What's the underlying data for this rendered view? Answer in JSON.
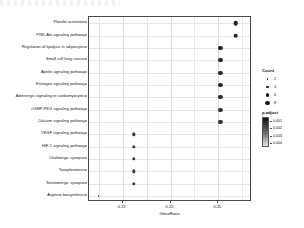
{
  "chart_data": {
    "type": "scatter",
    "plot_style": "dotplot",
    "title": "",
    "xlabel": "GeneRatio",
    "ylabel": "",
    "xlim": [
      0.115,
      0.285
    ],
    "xticks": [
      0.15,
      0.2,
      0.25
    ],
    "xticklabels": [
      "0.15",
      "0.20",
      "0.25"
    ],
    "grid": true,
    "categories": [
      "Platelet activation",
      "PI3K-Akt signaling pathway",
      "Regulation of lipolysis in adipocytes",
      "Small cell lung cancer",
      "Apelin signaling pathway",
      "Estrogen signaling pathway",
      "Adrenergic signaling in cardiomyocytes",
      "cGMP-PKG signaling pathway",
      "Calcium signaling pathway",
      "VEGF signaling pathway",
      "HIF-1 signaling pathway",
      "Cholinergic synapse",
      "Toxoplasmosis",
      "Serotonergic synapse",
      "Arginine biosynthesis"
    ],
    "points": [
      {
        "pathway": "Platelet activation",
        "gene_ratio": 0.268,
        "count": 8,
        "p_adjust": 0.001,
        "size_px": 4.6,
        "color": "#1c1c1c"
      },
      {
        "pathway": "PI3K-Akt signaling pathway",
        "gene_ratio": 0.268,
        "count": 8,
        "p_adjust": 0.002,
        "size_px": 4.6,
        "color": "#1f1f1f"
      },
      {
        "pathway": "Regulation of lipolysis in adipocytes",
        "gene_ratio": 0.252,
        "count": 7,
        "p_adjust": 0.002,
        "size_px": 4.2,
        "color": "#222222"
      },
      {
        "pathway": "Small cell lung cancer",
        "gene_ratio": 0.252,
        "count": 7,
        "p_adjust": 0.002,
        "size_px": 4.2,
        "color": "#242424"
      },
      {
        "pathway": "Apelin signaling pathway",
        "gene_ratio": 0.252,
        "count": 7,
        "p_adjust": 0.003,
        "size_px": 4.2,
        "color": "#272727"
      },
      {
        "pathway": "Estrogen signaling pathway",
        "gene_ratio": 0.252,
        "count": 7,
        "p_adjust": 0.003,
        "size_px": 4.2,
        "color": "#2a2a2a"
      },
      {
        "pathway": "Adrenergic signaling in cardiomyocytes",
        "gene_ratio": 0.252,
        "count": 7,
        "p_adjust": 0.003,
        "size_px": 4.2,
        "color": "#2c2c2c"
      },
      {
        "pathway": "cGMP-PKG signaling pathway",
        "gene_ratio": 0.252,
        "count": 7,
        "p_adjust": 0.004,
        "size_px": 4.2,
        "color": "#2f2f2f"
      },
      {
        "pathway": "Calcium signaling pathway",
        "gene_ratio": 0.252,
        "count": 7,
        "p_adjust": 0.004,
        "size_px": 4.2,
        "color": "#313131"
      },
      {
        "pathway": "VEGF signaling pathway",
        "gene_ratio": 0.162,
        "count": 5,
        "p_adjust": 0.004,
        "size_px": 3.4,
        "color": "#343434"
      },
      {
        "pathway": "HIF-1 signaling pathway",
        "gene_ratio": 0.162,
        "count": 5,
        "p_adjust": 0.004,
        "size_px": 3.4,
        "color": "#363636"
      },
      {
        "pathway": "Cholinergic synapse",
        "gene_ratio": 0.162,
        "count": 5,
        "p_adjust": 0.005,
        "size_px": 3.4,
        "color": "#383838"
      },
      {
        "pathway": "Toxoplasmosis",
        "gene_ratio": 0.162,
        "count": 5,
        "p_adjust": 0.005,
        "size_px": 3.4,
        "color": "#3a3a3a"
      },
      {
        "pathway": "Serotonergic synapse",
        "gene_ratio": 0.162,
        "count": 5,
        "p_adjust": 0.005,
        "size_px": 3.4,
        "color": "#3c3c3c"
      },
      {
        "pathway": "Arginine biosynthesis",
        "gene_ratio": 0.125,
        "count": 2,
        "p_adjust": 0.005,
        "size_px": 1.8,
        "color": "#3e3e3e"
      }
    ],
    "legends": {
      "size": {
        "title": "Count",
        "entries": [
          {
            "label": "2",
            "value": 2,
            "size_px": 1.9
          },
          {
            "label": "4",
            "value": 4,
            "size_px": 2.9
          },
          {
            "label": "6",
            "value": 6,
            "size_px": 3.9
          },
          {
            "label": "8",
            "value": 8,
            "size_px": 4.8
          }
        ]
      },
      "color": {
        "title": "p.adjust",
        "ticks": [
          "0.001",
          "0.002",
          "0.003",
          "0.004"
        ],
        "low_color": "#141414",
        "high_color": "#e8e8e8"
      },
      "position": "right"
    }
  }
}
